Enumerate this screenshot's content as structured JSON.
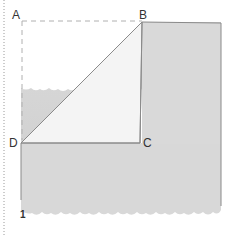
{
  "diagram": {
    "type": "paper-folding-step",
    "points": {
      "A": "A",
      "B": "B",
      "C": "C",
      "D": "D"
    },
    "step_number": "1",
    "colors": {
      "paper_fill": "#d9d9d9",
      "triangle_fill": "#f3f3f3",
      "outline": "#8a8a8a",
      "dashed_line": "#b0b0b0",
      "margin_dots": "#9a9a9a",
      "label": "#333333"
    }
  }
}
